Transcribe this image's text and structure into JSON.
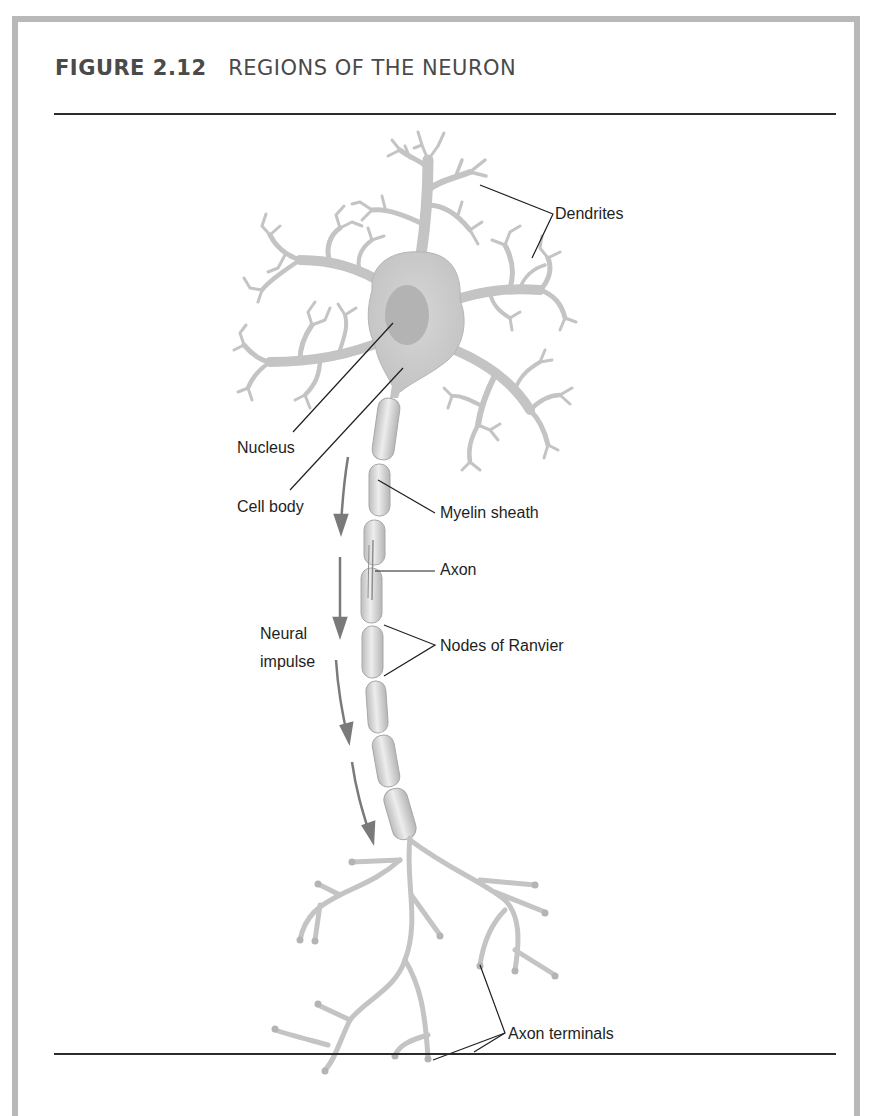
{
  "figure": {
    "number": "FIGURE 2.12",
    "title": "REGIONS OF THE NEURON"
  },
  "labels": {
    "dendrites": "Dendrites",
    "nucleus": "Nucleus",
    "cell_body": "Cell body",
    "myelin_sheath": "Myelin sheath",
    "axon": "Axon",
    "neural_impulse_line1": "Neural",
    "neural_impulse_line2": "impulse",
    "nodes_of_ranvier": "Nodes of Ranvier",
    "axon_terminals": "Axon terminals"
  },
  "colors": {
    "neuron_fill": "#c9c9c9",
    "neuron_dark": "#a9a9a9",
    "nucleus": "#b3b3b3",
    "leader_line": "#1e1e1e",
    "arrow": "#7a7a7a",
    "frame": "#b9b9b9"
  }
}
